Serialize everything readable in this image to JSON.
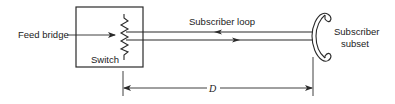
{
  "diagram": {
    "labels": {
      "feed_bridge": "Feed bridge",
      "switch": "Switch",
      "subscriber_loop": "Subscriber loop",
      "subscriber_subset_line1": "Subscriber",
      "subscriber_subset_line2": "subset",
      "distance": "D"
    },
    "colors": {
      "stroke": "#2a2a2a",
      "text": "#222222",
      "background": "#ffffff"
    },
    "arrows": {
      "upper_loop_direction": "toward-switch",
      "lower_loop_direction": "toward-subset",
      "feed_bridge_direction": "into-switch",
      "distance": "double-headed"
    }
  }
}
